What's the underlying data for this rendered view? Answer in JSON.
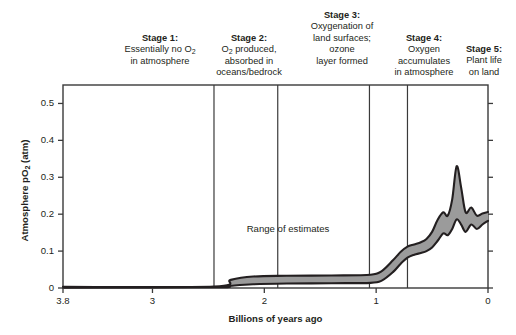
{
  "chart_data": {
    "type": "area",
    "title": "",
    "xlabel": "Billions of years ago",
    "ylabel": "Atmosphere pO2 (atm)",
    "xlim": [
      3.8,
      0
    ],
    "ylim": [
      0,
      0.55
    ],
    "x_ticks": [
      "3.8",
      "3",
      "2",
      "1",
      "0"
    ],
    "x_tick_values": [
      3.8,
      3,
      2,
      1,
      0
    ],
    "y_ticks": [
      "0",
      "0.1",
      "0.2",
      "0.3",
      "0.4",
      "0.5"
    ],
    "y_tick_values": [
      0,
      0.1,
      0.2,
      0.3,
      0.4,
      0.5
    ],
    "grid": false,
    "legend": "none",
    "annotation": "Range of estimates",
    "band_fill_color": "#9b9b9b",
    "band_line_color": "#231f20",
    "axis_color": "#3a3a3a",
    "series": [
      {
        "name": "Upper estimate",
        "x": [
          3.8,
          2.45,
          2.3,
          2.1,
          1.8,
          1.4,
          1.05,
          0.95,
          0.85,
          0.78,
          0.72,
          0.66,
          0.6,
          0.55,
          0.5,
          0.45,
          0.4,
          0.36,
          0.32,
          0.28,
          0.24,
          0.2,
          0.15,
          0.1,
          0.05,
          0.0
        ],
        "values": [
          0.003,
          0.004,
          0.022,
          0.031,
          0.033,
          0.034,
          0.036,
          0.046,
          0.075,
          0.098,
          0.112,
          0.118,
          0.124,
          0.133,
          0.152,
          0.185,
          0.205,
          0.196,
          0.24,
          0.33,
          0.272,
          0.205,
          0.218,
          0.196,
          0.202,
          0.206
        ]
      },
      {
        "name": "Lower estimate",
        "x": [
          3.8,
          2.45,
          2.3,
          2.1,
          1.8,
          1.4,
          1.05,
          0.95,
          0.85,
          0.78,
          0.72,
          0.66,
          0.6,
          0.55,
          0.5,
          0.45,
          0.4,
          0.36,
          0.32,
          0.28,
          0.24,
          0.2,
          0.15,
          0.1,
          0.05,
          0.0
        ],
        "values": [
          0.001,
          0.002,
          0.006,
          0.01,
          0.012,
          0.013,
          0.014,
          0.02,
          0.043,
          0.066,
          0.082,
          0.09,
          0.095,
          0.1,
          0.11,
          0.128,
          0.148,
          0.143,
          0.16,
          0.186,
          0.172,
          0.152,
          0.172,
          0.16,
          0.172,
          0.182
        ]
      }
    ],
    "stage_dividers": [
      2.45,
      1.88,
      1.06,
      0.72
    ]
  },
  "stages": [
    {
      "id": "stage-1",
      "title": "Stage 1:",
      "line1": "Essentially no O",
      "sub1": "2",
      "line2": "in atmosphere",
      "line3": "",
      "line4": ""
    },
    {
      "id": "stage-2",
      "title": "Stage 2:",
      "line1": "O",
      "sub1": "2",
      "line1b": " produced,",
      "line2": "absorbed in",
      "line3": "oceans/bedrock",
      "line4": ""
    },
    {
      "id": "stage-3",
      "title": "Stage 3:",
      "line1": "Oxygenation of",
      "line2": "land surfaces;",
      "line3": "ozone",
      "line4": "layer formed"
    },
    {
      "id": "stage-4",
      "title": "Stage 4:",
      "line1": "Oxygen",
      "line2": "accumulates",
      "line3": "in atmosphere",
      "line4": ""
    },
    {
      "id": "stage-5",
      "title": "Stage 5:",
      "line1": "Plant life",
      "line2": "on land",
      "line3": "",
      "line4": ""
    }
  ]
}
